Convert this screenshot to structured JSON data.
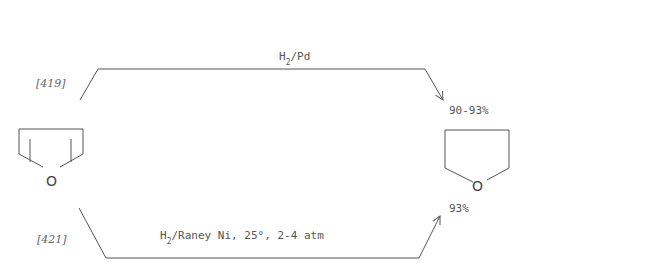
{
  "reactant": {
    "name": "furan",
    "heteroatom": "O"
  },
  "product": {
    "name": "tetrahydrofuran",
    "heteroatom": "O"
  },
  "routes": [
    {
      "ref": "[419]",
      "reagent_main": "H",
      "reagent_sub": "2",
      "reagent_rest": "/Pd",
      "yield": "90-93%"
    },
    {
      "ref": "[421]",
      "reagent_main": "H",
      "reagent_sub": "2",
      "reagent_rest": "/Raney Ni, 25°, 2-4 atm",
      "yield": "93%"
    }
  ],
  "colors": {
    "line": "#555555",
    "text": "#555555",
    "background": "#ffffff"
  }
}
